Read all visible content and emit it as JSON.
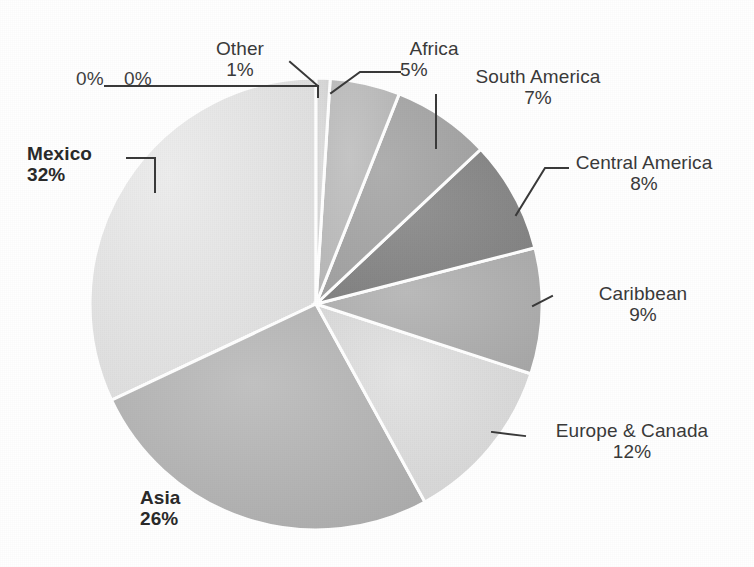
{
  "chart_data": {
    "type": "pie",
    "title": "",
    "subtitle": "",
    "xlabel": "",
    "ylabel": "",
    "legend_position": "none",
    "grid": false,
    "labels_show_percent": true,
    "start_angle_deg": 0,
    "direction": "clockwise",
    "categories": [
      "Other",
      "Africa",
      "South America",
      "Central America",
      "Caribbean",
      "Europe & Canada",
      "Asia",
      "Mexico"
    ],
    "values": [
      1,
      5,
      7,
      8,
      9,
      12,
      26,
      32
    ],
    "units": "percent",
    "extra_zero_labels": [
      "0%",
      "0%"
    ],
    "slices": [
      {
        "label": "Other",
        "percent_text": "1%",
        "value": 1,
        "color": "#d8d8d8",
        "bold": false
      },
      {
        "label": "Africa",
        "percent_text": "5%",
        "value": 5,
        "color": "#bcbcbc",
        "bold": false
      },
      {
        "label": "South America",
        "percent_text": "7%",
        "value": 7,
        "color": "#a8a8a8",
        "bold": false
      },
      {
        "label": "Central America",
        "percent_text": "8%",
        "value": 8,
        "color": "#8a8a8a",
        "bold": false
      },
      {
        "label": "Caribbean",
        "percent_text": "9%",
        "value": 9,
        "color": "#b2b2b2",
        "bold": false
      },
      {
        "label": "Europe & Canada",
        "percent_text": "12%",
        "value": 12,
        "color": "#dcdcdc",
        "bold": false
      },
      {
        "label": "Asia",
        "percent_text": "26%",
        "value": 26,
        "color": "#b4b4b4",
        "bold": true
      },
      {
        "label": "Mexico",
        "percent_text": "32%",
        "value": 32,
        "color": "#e2e2e2",
        "bold": true
      }
    ]
  },
  "labels": {
    "zero_a": "0%",
    "zero_b": "0%",
    "other_name": "Other",
    "other_pct": "1%",
    "africa_name": "Africa",
    "africa_pct": "5%",
    "south_america_name": "South America",
    "south_america_pct": "7%",
    "central_america_name": "Central America",
    "central_america_pct": "8%",
    "caribbean_name": "Caribbean",
    "caribbean_pct": "9%",
    "europe_canada_name": "Europe & Canada",
    "europe_canada_pct": "12%",
    "asia_name": "Asia",
    "asia_pct": "26%",
    "mexico_name": "Mexico",
    "mexico_pct": "32%"
  },
  "style": {
    "background": "#ffffff",
    "slice_border": "#ffffff",
    "leader_line": "#3a3a3a",
    "text": "#3a3a3a"
  }
}
